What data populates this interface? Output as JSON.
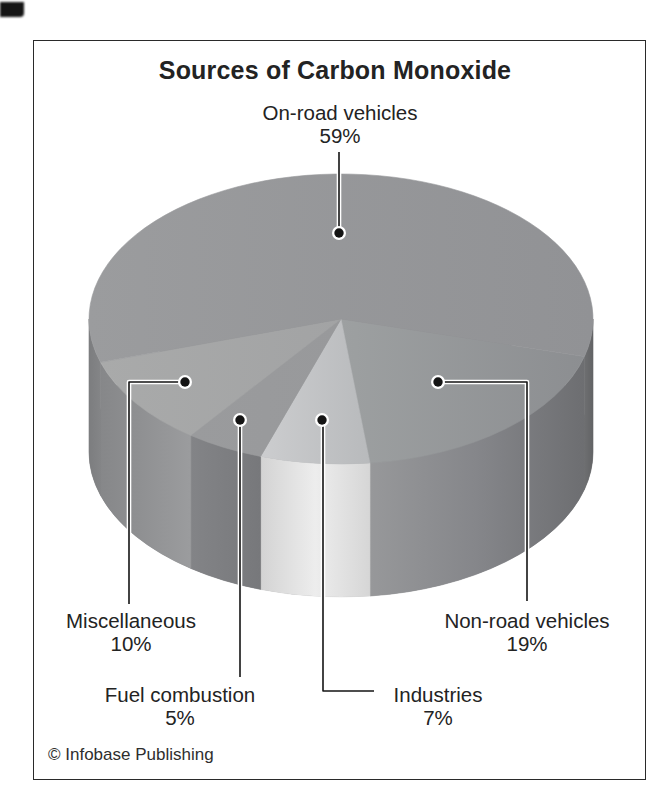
{
  "figure": {
    "title": "Sources of Carbon Monoxide",
    "copyright": "© Infobase Publishing"
  },
  "chart_data": {
    "type": "pie",
    "style": "3d-cylinder",
    "title": "Sources of Carbon Monoxide",
    "unit": "%",
    "labels_with_leader_lines": true,
    "legend_position": "labels-around-chart",
    "slices": [
      {
        "label": "On-road vehicles",
        "value": 59,
        "pct_label": "59%"
      },
      {
        "label": "Non-road vehicles",
        "value": 19,
        "pct_label": "19%"
      },
      {
        "label": "Miscellaneous",
        "value": 10,
        "pct_label": "10%"
      },
      {
        "label": "Industries",
        "value": 7,
        "pct_label": "7%"
      },
      {
        "label": "Fuel combustion",
        "value": 5,
        "pct_label": "5%"
      }
    ],
    "palette_grays": {
      "on_road_top": "#9b9c9e",
      "non_road_top": "#9da0a1",
      "miscellaneous_top": "#a9aaaa",
      "fuel_combustion_top": "#9a9b9d",
      "industries_top": "#cbccce",
      "industries_side_highlight": "#ededed",
      "darkest_side": "#626365"
    }
  }
}
